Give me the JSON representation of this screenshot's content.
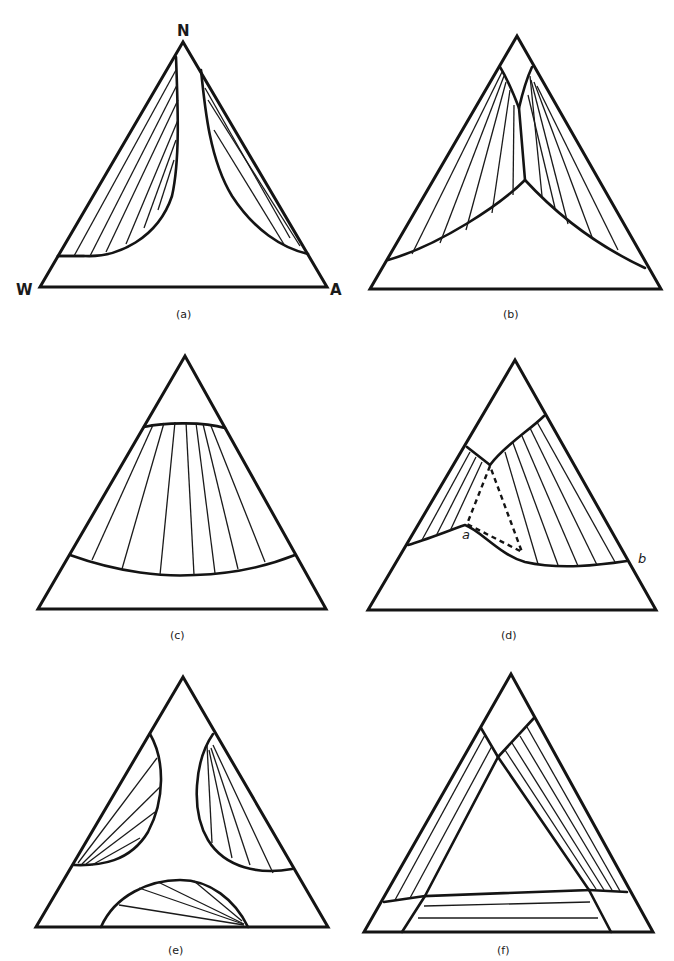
{
  "figure": {
    "panels": [
      {
        "id": "a",
        "caption": "(a)",
        "vertices": {
          "top": "N",
          "left": "W",
          "right": "A"
        },
        "description": "Two separate two-phase regions along the W-N and N-A edges, meeting near N"
      },
      {
        "id": "b",
        "caption": "(b)",
        "description": "Two two-phase regions merging at a cusp in the center, small homogeneous region at apex"
      },
      {
        "id": "c",
        "caption": "(c)",
        "description": "Single band-shaped two-phase region spanning across the triangle"
      },
      {
        "id": "d",
        "caption": "(d)",
        "point_labels": [
          "a",
          "b"
        ],
        "description": "Two-phase regions with dashed three-phase triangle"
      },
      {
        "id": "e",
        "caption": "(e)",
        "description": "Three separate two-phase lobes, one on each edge"
      },
      {
        "id": "f",
        "caption": "(f)",
        "description": "Three overlapping band regions forming an inner triangle"
      }
    ]
  }
}
